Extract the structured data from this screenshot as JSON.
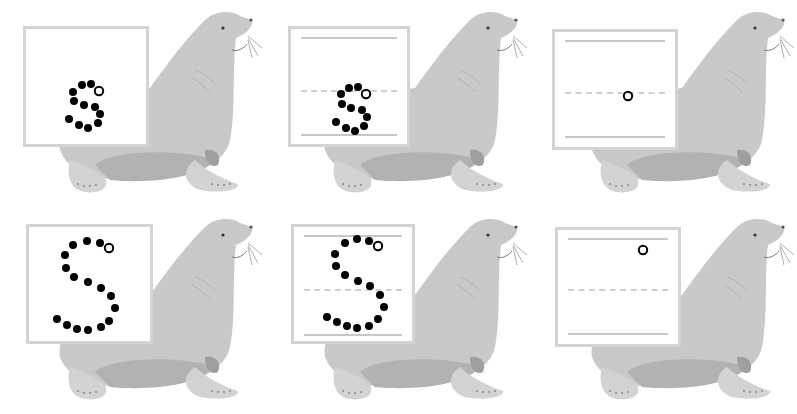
{
  "worksheet": {
    "subject": "letter tracing S s",
    "panels": [
      {
        "id": "p1",
        "row": 1,
        "col": 1,
        "letter": "s",
        "case": "lowercase",
        "guides": false,
        "dotted": true
      },
      {
        "id": "p2",
        "row": 1,
        "col": 2,
        "letter": "s",
        "case": "lowercase",
        "guides": true,
        "dotted": true
      },
      {
        "id": "p3",
        "row": 1,
        "col": 3,
        "letter": "s",
        "case": "lowercase",
        "guides": true,
        "dotted": false,
        "start_point_only": true
      },
      {
        "id": "p4",
        "row": 2,
        "col": 1,
        "letter": "S",
        "case": "uppercase",
        "guides": false,
        "dotted": true
      },
      {
        "id": "p5",
        "row": 2,
        "col": 2,
        "letter": "S",
        "case": "uppercase",
        "guides": true,
        "dotted": true
      },
      {
        "id": "p6",
        "row": 2,
        "col": 3,
        "letter": "S",
        "case": "uppercase",
        "guides": true,
        "dotted": false,
        "start_point_only": true
      }
    ],
    "illustration": "sea-lion",
    "colors": {
      "dot": "#000000",
      "card_border": "#d4d4d4",
      "guide_line": "#c8c8c8",
      "seal_body": "#c9c9c9",
      "seal_shadow": "#a9a9a9"
    }
  }
}
